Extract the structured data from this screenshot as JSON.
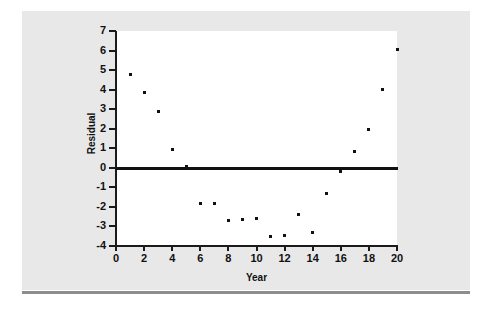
{
  "chart_data": {
    "type": "scatter",
    "title": "",
    "xlabel": "Year",
    "ylabel": "Residual",
    "xlim": [
      0,
      20
    ],
    "ylim": [
      -4,
      7
    ],
    "grid": false,
    "legend": null,
    "x_ticks": [
      "0",
      "2",
      "4",
      "6",
      "8",
      "10",
      "12",
      "14",
      "16",
      "18",
      "20"
    ],
    "x_tick_values": [
      0,
      2,
      4,
      6,
      8,
      10,
      12,
      14,
      16,
      18,
      20
    ],
    "y_ticks": [
      "7",
      "6",
      "5",
      "4",
      "3",
      "2",
      "1",
      "0",
      "-1",
      "-2",
      "-3",
      "-4"
    ],
    "y_tick_values": [
      7,
      6,
      5,
      4,
      3,
      2,
      1,
      0,
      -1,
      -2,
      -3,
      -4
    ],
    "reference_line": {
      "orientation": "horizontal",
      "value": 0
    },
    "x": [
      1,
      2,
      3,
      4,
      5,
      6,
      7,
      8,
      9,
      10,
      11,
      12,
      13,
      14,
      15,
      16,
      17,
      18,
      19,
      20
    ],
    "y": [
      4.8,
      3.85,
      2.9,
      0.95,
      0.05,
      -1.85,
      -1.8,
      -2.7,
      -2.65,
      -2.6,
      -3.5,
      -3.45,
      -2.4,
      -3.3,
      -1.3,
      -0.2,
      0.85,
      1.95,
      4.0,
      6.05
    ],
    "points": [
      {
        "x": 1,
        "y": 4.8
      },
      {
        "x": 2,
        "y": 3.85
      },
      {
        "x": 3,
        "y": 2.9
      },
      {
        "x": 4,
        "y": 0.95
      },
      {
        "x": 5,
        "y": 0.05
      },
      {
        "x": 6,
        "y": -1.85
      },
      {
        "x": 7,
        "y": -1.8
      },
      {
        "x": 8,
        "y": -2.7
      },
      {
        "x": 9,
        "y": -2.65
      },
      {
        "x": 10,
        "y": -2.6
      },
      {
        "x": 11,
        "y": -3.5
      },
      {
        "x": 12,
        "y": -3.45
      },
      {
        "x": 13,
        "y": -2.4
      },
      {
        "x": 14,
        "y": -3.3
      },
      {
        "x": 15,
        "y": -1.3
      },
      {
        "x": 16,
        "y": -0.2
      },
      {
        "x": 17,
        "y": 0.85
      },
      {
        "x": 18,
        "y": 1.95
      },
      {
        "x": 19,
        "y": 4.0
      },
      {
        "x": 20,
        "y": 6.05
      }
    ]
  },
  "colors": {
    "page_background": "#ffffff",
    "card_background": "#e8e8e8",
    "plot_background": "#ffffff",
    "axis": "#1a1a1a",
    "marker": "#111111",
    "reference_line": "#111111",
    "bottom_rule": "#8d8d90"
  }
}
